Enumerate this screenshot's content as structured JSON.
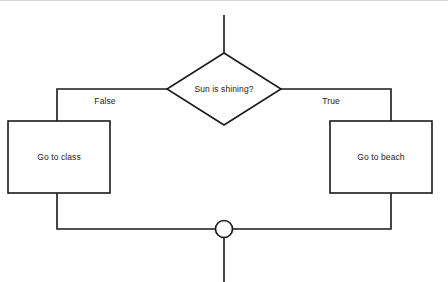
{
  "diagram": {
    "type": "flowchart",
    "title": "",
    "decision": {
      "id": "decision-sun",
      "label": "Sun is shining?",
      "shape": "diamond",
      "center_x": 224,
      "center_y": 88,
      "half_width": 57,
      "half_height": 36
    },
    "branches": [
      {
        "id": "branch-false",
        "label": "False",
        "side": "left",
        "label_x": 105,
        "label_y": 101
      },
      {
        "id": "branch-true",
        "label": "True",
        "side": "right",
        "label_x": 331,
        "label_y": 101
      }
    ],
    "processes": [
      {
        "id": "process-go-to-class",
        "label": "Go to class",
        "shape": "rectangle",
        "x": 8,
        "y": 120,
        "width": 102,
        "height": 72
      },
      {
        "id": "process-go-to-beach",
        "label": "Go to beach",
        "shape": "rectangle",
        "x": 330,
        "y": 120,
        "width": 102,
        "height": 72
      }
    ],
    "merge": {
      "id": "merge-junction",
      "shape": "circle",
      "center_x": 224,
      "center_y": 228,
      "radius": 8.5
    },
    "connectors": {
      "entry_top": "M224,14 L224,52",
      "left_branch": "M167,88 L57,88 L57,120",
      "right_branch": "M281,88 L391,88 L391,120",
      "left_to_merge": "M57,192 L57,228 L215.5,228",
      "right_to_merge": "M391,192 L391,228 L232.5,228",
      "exit_bottom": "M224,236.5 L224,282"
    },
    "colors": {
      "stroke": "#1a1a1a",
      "text": "#1c1c1c",
      "background": "#ffffff",
      "frame_border": "#d8d8d8"
    }
  }
}
